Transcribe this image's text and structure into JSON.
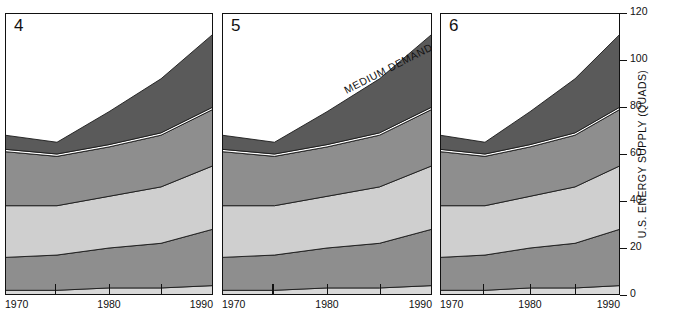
{
  "figure": {
    "width": 676,
    "height": 321,
    "background": "#ffffff",
    "axis_color": "#111111"
  },
  "y_axis": {
    "title": "U.S. ENERGY SUPPLY (QUADS)",
    "ticks": [
      0,
      20,
      40,
      60,
      80,
      100,
      120
    ],
    "tick_labels": [
      "0",
      "20",
      "40",
      "60",
      "80",
      "100",
      "120"
    ],
    "min": 0,
    "max": 120,
    "position": "right"
  },
  "x_axis": {
    "ticks": [
      1970,
      1975,
      1980,
      1985,
      1990
    ],
    "labeled_ticks": [
      1970,
      1980,
      1990
    ],
    "labels": [
      "1970",
      "1980",
      "1990"
    ],
    "min": 1970,
    "max": 1990
  },
  "annotations": [
    {
      "text": "MEDIUM DEMAND",
      "panel": "5",
      "rotation_deg": -27
    }
  ],
  "panels": [
    {
      "id": "panel-4",
      "number": "4",
      "x": 5,
      "width": 208
    },
    {
      "id": "panel-5",
      "number": "5",
      "x": 222,
      "width": 210
    },
    {
      "id": "panel-6",
      "number": "6",
      "x": 440,
      "width": 180
    }
  ],
  "series_colors": {
    "band1_bottom_light": "#d8d8d8",
    "band2_mid_gray": "#8e8e8e",
    "band3_light_gray": "#cfcfcf",
    "band4_mid_gray": "#8e8e8e",
    "band5_thin_white": "#ffffff",
    "band6_dark_gray": "#5a5a5a"
  },
  "chart_data": {
    "type": "area",
    "title": "",
    "subtitle": "",
    "xlabel": "",
    "ylabel": "U.S. ENERGY SUPPLY (QUADS)",
    "xlim": [
      1970,
      1990
    ],
    "ylim": [
      0,
      120
    ],
    "grid": false,
    "legend": "none",
    "stacked": true,
    "x": [
      1970,
      1975,
      1980,
      1985,
      1990
    ],
    "panels": [
      {
        "panel": "4",
        "label": "4",
        "series": [
          {
            "name": "Hydro / Other",
            "values": [
              2,
              2,
              3,
              3,
              4
            ]
          },
          {
            "name": "Coal",
            "values": [
              14,
              15,
              17,
              19,
              24
            ]
          },
          {
            "name": "Nuclear / Gas",
            "values": [
              22,
              21,
              22,
              24,
              27
            ]
          },
          {
            "name": "Oil (domestic)",
            "values": [
              23,
              21,
              21,
              22,
              24
            ]
          },
          {
            "name": "Transition",
            "values": [
              1,
              1,
              1,
              1,
              1
            ]
          },
          {
            "name": "Imports",
            "values": [
              6,
              5,
              14,
              23,
              31
            ]
          }
        ],
        "totals": [
          68,
          65,
          78,
          92,
          111
        ]
      },
      {
        "panel": "5",
        "label": "5",
        "series": [
          {
            "name": "Hydro / Other",
            "values": [
              2,
              2,
              3,
              3,
              4
            ]
          },
          {
            "name": "Coal",
            "values": [
              14,
              15,
              17,
              19,
              24
            ]
          },
          {
            "name": "Nuclear / Gas",
            "values": [
              22,
              21,
              22,
              24,
              27
            ]
          },
          {
            "name": "Oil (domestic)",
            "values": [
              23,
              21,
              21,
              22,
              24
            ]
          },
          {
            "name": "Transition",
            "values": [
              1,
              1,
              1,
              1,
              1
            ]
          },
          {
            "name": "Imports",
            "values": [
              6,
              5,
              14,
              23,
              31
            ]
          }
        ],
        "totals": [
          68,
          65,
          78,
          92,
          111
        ]
      },
      {
        "panel": "6",
        "label": "6",
        "series": [
          {
            "name": "Hydro / Other",
            "values": [
              2,
              2,
              3,
              3,
              4
            ]
          },
          {
            "name": "Coal",
            "values": [
              14,
              15,
              17,
              19,
              24
            ]
          },
          {
            "name": "Nuclear / Gas",
            "values": [
              22,
              21,
              22,
              24,
              27
            ]
          },
          {
            "name": "Oil (domestic)",
            "values": [
              23,
              21,
              21,
              22,
              24
            ]
          },
          {
            "name": "Transition",
            "values": [
              1,
              1,
              1,
              1,
              1
            ]
          },
          {
            "name": "Imports",
            "values": [
              6,
              5,
              14,
              23,
              31
            ]
          }
        ],
        "totals": [
          68,
          65,
          78,
          92,
          111
        ]
      }
    ]
  }
}
